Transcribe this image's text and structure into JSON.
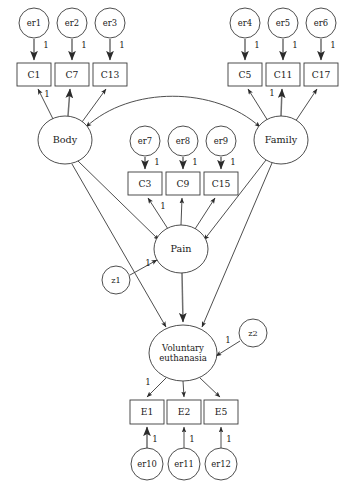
{
  "diagram": {
    "type": "sem-path-diagram",
    "background_color": "#ffffff",
    "stroke_color": "#3a3a3a",
    "text_color": "#1a1a1a",
    "canvas": {
      "width": 347,
      "height": 488
    },
    "latent_variables": [
      {
        "id": "body",
        "label": "Body",
        "shape": "ellipse",
        "cx": 65,
        "cy": 140,
        "rx": 27,
        "ry": 24
      },
      {
        "id": "family",
        "label": "Family",
        "shape": "ellipse",
        "cx": 281,
        "cy": 140,
        "rx": 27,
        "ry": 24
      },
      {
        "id": "pain",
        "label": "Pain",
        "shape": "ellipse",
        "cx": 181,
        "cy": 249,
        "rx": 27,
        "ry": 24
      },
      {
        "id": "voluntary_euthanasia",
        "label_line1": "Voluntary",
        "label_line2": "euthanasia",
        "shape": "ellipse",
        "cx": 183,
        "cy": 353,
        "rx": 34,
        "ry": 28
      }
    ],
    "indicators": [
      {
        "id": "c1",
        "label": "C1",
        "shape": "rect",
        "x": 17,
        "y": 63,
        "w": 34,
        "h": 23
      },
      {
        "id": "c7",
        "label": "C7",
        "shape": "rect",
        "x": 55,
        "y": 63,
        "w": 34,
        "h": 23
      },
      {
        "id": "c13",
        "label": "C13",
        "shape": "rect",
        "x": 93,
        "y": 63,
        "w": 34,
        "h": 23
      },
      {
        "id": "c5",
        "label": "C5",
        "shape": "rect",
        "x": 228,
        "y": 63,
        "w": 34,
        "h": 23
      },
      {
        "id": "c11",
        "label": "C11",
        "shape": "rect",
        "x": 266,
        "y": 63,
        "w": 34,
        "h": 23
      },
      {
        "id": "c17",
        "label": "C17",
        "shape": "rect",
        "x": 304,
        "y": 63,
        "w": 34,
        "h": 23
      },
      {
        "id": "c3",
        "label": "C3",
        "shape": "rect",
        "x": 128,
        "y": 172,
        "w": 34,
        "h": 23
      },
      {
        "id": "c9",
        "label": "C9",
        "shape": "rect",
        "x": 166,
        "y": 172,
        "w": 34,
        "h": 23
      },
      {
        "id": "c15",
        "label": "C15",
        "shape": "rect",
        "x": 204,
        "y": 172,
        "w": 34,
        "h": 23
      },
      {
        "id": "e1",
        "label": "E1",
        "shape": "rect",
        "x": 130,
        "y": 400,
        "w": 34,
        "h": 24
      },
      {
        "id": "e2",
        "label": "E2",
        "shape": "rect",
        "x": 167,
        "y": 400,
        "w": 34,
        "h": 24
      },
      {
        "id": "e5",
        "label": "E5",
        "shape": "rect",
        "x": 204,
        "y": 400,
        "w": 34,
        "h": 24
      }
    ],
    "errors": [
      {
        "id": "er1",
        "label": "er1",
        "shape": "circle",
        "cx": 34,
        "cy": 23,
        "r": 15
      },
      {
        "id": "er2",
        "label": "er2",
        "shape": "circle",
        "cx": 72,
        "cy": 23,
        "r": 15
      },
      {
        "id": "er3",
        "label": "er3",
        "shape": "circle",
        "cx": 110,
        "cy": 23,
        "r": 15
      },
      {
        "id": "er4",
        "label": "er4",
        "shape": "circle",
        "cx": 245,
        "cy": 23,
        "r": 15
      },
      {
        "id": "er5",
        "label": "er5",
        "shape": "circle",
        "cx": 283,
        "cy": 23,
        "r": 15
      },
      {
        "id": "er6",
        "label": "er6",
        "shape": "circle",
        "cx": 321,
        "cy": 23,
        "r": 15
      },
      {
        "id": "er7",
        "label": "er7",
        "shape": "circle",
        "cx": 145,
        "cy": 141,
        "r": 15
      },
      {
        "id": "er8",
        "label": "er8",
        "shape": "circle",
        "cx": 183,
        "cy": 141,
        "r": 15
      },
      {
        "id": "er9",
        "label": "er9",
        "shape": "circle",
        "cx": 221,
        "cy": 141,
        "r": 15
      },
      {
        "id": "er10",
        "label": "er10",
        "shape": "circle",
        "cx": 147,
        "cy": 464,
        "r": 16
      },
      {
        "id": "er11",
        "label": "er11",
        "shape": "circle",
        "cx": 184,
        "cy": 464,
        "r": 16
      },
      {
        "id": "er12",
        "label": "er12",
        "shape": "circle",
        "cx": 221,
        "cy": 464,
        "r": 16
      }
    ],
    "disturbances": [
      {
        "id": "z1",
        "label": "z1",
        "shape": "circle",
        "cx": 116,
        "cy": 280,
        "r": 14
      },
      {
        "id": "z2",
        "label": "z2",
        "shape": "circle",
        "cx": 253,
        "cy": 333,
        "r": 14
      }
    ],
    "coefficient_labels": [
      {
        "id": "coef-er1-c1",
        "text": "1",
        "x": 46,
        "y": 45
      },
      {
        "id": "coef-er2-c7",
        "text": "1",
        "x": 84,
        "y": 45
      },
      {
        "id": "coef-er3-c13",
        "text": "1",
        "x": 122,
        "y": 45
      },
      {
        "id": "coef-er4-c5",
        "text": "1",
        "x": 257,
        "y": 45
      },
      {
        "id": "coef-er5-c11",
        "text": "1",
        "x": 295,
        "y": 45
      },
      {
        "id": "coef-er6-c17",
        "text": "1",
        "x": 333,
        "y": 45
      },
      {
        "id": "coef-body-c1",
        "text": "1",
        "x": 47,
        "y": 94
      },
      {
        "id": "coef-family-c5",
        "text": "1",
        "x": 272,
        "y": 93
      },
      {
        "id": "coef-er7-c3",
        "text": "1",
        "x": 157,
        "y": 162
      },
      {
        "id": "coef-er8-c9",
        "text": "1",
        "x": 195,
        "y": 162
      },
      {
        "id": "coef-er9-c15",
        "text": "1",
        "x": 233,
        "y": 162
      },
      {
        "id": "coef-pain-c3",
        "text": "1",
        "x": 163,
        "y": 206
      },
      {
        "id": "coef-z1-pain",
        "text": "1",
        "x": 148,
        "y": 263
      },
      {
        "id": "coef-z2-ve",
        "text": "1",
        "x": 228,
        "y": 340
      },
      {
        "id": "coef-ve-e1",
        "text": "1",
        "x": 148,
        "y": 382
      },
      {
        "id": "coef-er10-e1",
        "text": "1",
        "x": 155,
        "y": 439
      },
      {
        "id": "coef-er11-e2",
        "text": "1",
        "x": 192,
        "y": 439
      },
      {
        "id": "coef-er12-e5",
        "text": "1",
        "x": 229,
        "y": 439
      }
    ],
    "paths": [
      {
        "id": "er1-to-c1",
        "from": "er1",
        "to": "c1",
        "kind": "directed",
        "d": "M 34 39 L 34 60",
        "emphasis": "thick"
      },
      {
        "id": "er2-to-c7",
        "from": "er2",
        "to": "c7",
        "kind": "directed",
        "d": "M 72 39 L 72 60",
        "emphasis": "thick"
      },
      {
        "id": "er3-to-c13",
        "from": "er3",
        "to": "c13",
        "kind": "directed",
        "d": "M 110 39 L 110 60",
        "emphasis": "thick"
      },
      {
        "id": "er4-to-c5",
        "from": "er4",
        "to": "c5",
        "kind": "directed",
        "d": "M 245 39 L 245 60",
        "emphasis": "thick"
      },
      {
        "id": "er5-to-c11",
        "from": "er5",
        "to": "c11",
        "kind": "directed",
        "d": "M 283 39 L 283 60",
        "emphasis": "thick"
      },
      {
        "id": "er6-to-c17",
        "from": "er6",
        "to": "c17",
        "kind": "directed",
        "d": "M 321 39 L 321 60",
        "emphasis": "thick"
      },
      {
        "id": "body-to-c1",
        "from": "body",
        "to": "c1",
        "kind": "directed",
        "d": "M 53 119 L 38 89"
      },
      {
        "id": "body-to-c7",
        "from": "body",
        "to": "c7",
        "kind": "directed",
        "d": "M 68 116 L 70 89",
        "emphasis": "thick"
      },
      {
        "id": "body-to-c13",
        "from": "body",
        "to": "c13",
        "kind": "directed",
        "d": "M 82 122 L 106 89"
      },
      {
        "id": "family-to-c5",
        "from": "family",
        "to": "c5",
        "kind": "directed",
        "d": "M 268 121 L 248 89"
      },
      {
        "id": "family-to-c11",
        "from": "family",
        "to": "c11",
        "kind": "directed",
        "d": "M 281 116 L 282 89",
        "emphasis": "thick"
      },
      {
        "id": "family-to-c17",
        "from": "family",
        "to": "c17",
        "kind": "directed",
        "d": "M 295 122 L 317 89"
      },
      {
        "id": "body-family-covariance",
        "from": "body",
        "to": "family",
        "kind": "bidirected",
        "d": "M 86 127 C 130 86 215 86 260 127"
      },
      {
        "id": "er7-to-c3",
        "from": "er7",
        "to": "c3",
        "kind": "directed",
        "d": "M 145 157 L 145 169",
        "emphasis": "thick"
      },
      {
        "id": "er8-to-c9",
        "from": "er8",
        "to": "c9",
        "kind": "directed",
        "d": "M 183 157 L 183 169",
        "emphasis": "thick"
      },
      {
        "id": "er9-to-c15",
        "from": "er9",
        "to": "c15",
        "kind": "directed",
        "d": "M 221 157 L 221 169",
        "emphasis": "thick"
      },
      {
        "id": "pain-to-c3",
        "from": "pain",
        "to": "c3",
        "kind": "directed",
        "d": "M 168 229 L 148 198"
      },
      {
        "id": "pain-to-c9",
        "from": "pain",
        "to": "c9",
        "kind": "directed",
        "d": "M 181 225 L 182 198"
      },
      {
        "id": "pain-to-c15",
        "from": "pain",
        "to": "c15",
        "kind": "directed",
        "d": "M 195 229 L 215 198"
      },
      {
        "id": "body-to-pain",
        "from": "body",
        "to": "pain",
        "kind": "directed",
        "d": "M 78 161 L 159 240"
      },
      {
        "id": "family-to-pain",
        "from": "family",
        "to": "pain",
        "kind": "directed",
        "d": "M 266 160 L 204 240"
      },
      {
        "id": "z1-to-pain",
        "from": "z1",
        "to": "pain",
        "kind": "directed",
        "d": "M 130 275 L 157 260"
      },
      {
        "id": "body-to-ve",
        "from": "body",
        "to": "ve",
        "kind": "directed",
        "d": "M 72 164 L 166 327"
      },
      {
        "id": "family-to-ve",
        "from": "family",
        "to": "ve",
        "kind": "directed",
        "d": "M 272 163 L 202 327"
      },
      {
        "id": "pain-to-ve",
        "from": "pain",
        "to": "ve",
        "kind": "directed",
        "d": "M 182 273 L 183 322",
        "emphasis": "thick"
      },
      {
        "id": "z2-to-ve",
        "from": "z2",
        "to": "ve",
        "kind": "directed",
        "d": "M 240 341 L 216 356"
      },
      {
        "id": "ve-to-e1",
        "from": "ve",
        "to": "e1",
        "kind": "directed",
        "d": "M 166 378 L 147 397"
      },
      {
        "id": "ve-to-e2",
        "from": "ve",
        "to": "e2",
        "kind": "directed",
        "d": "M 183 381 L 184 397"
      },
      {
        "id": "ve-to-e5",
        "from": "ve",
        "to": "e5",
        "kind": "directed",
        "d": "M 200 378 L 220 397"
      },
      {
        "id": "er10-to-e1",
        "from": "er10",
        "to": "e1",
        "kind": "directed",
        "d": "M 147 448 L 147 427",
        "emphasis": "thick"
      },
      {
        "id": "er11-to-e2",
        "from": "er11",
        "to": "e2",
        "kind": "directed",
        "d": "M 184 448 L 184 427"
      },
      {
        "id": "er12-to-e5",
        "from": "er12",
        "to": "e5",
        "kind": "directed",
        "d": "M 221 448 L 221 427"
      }
    ]
  }
}
